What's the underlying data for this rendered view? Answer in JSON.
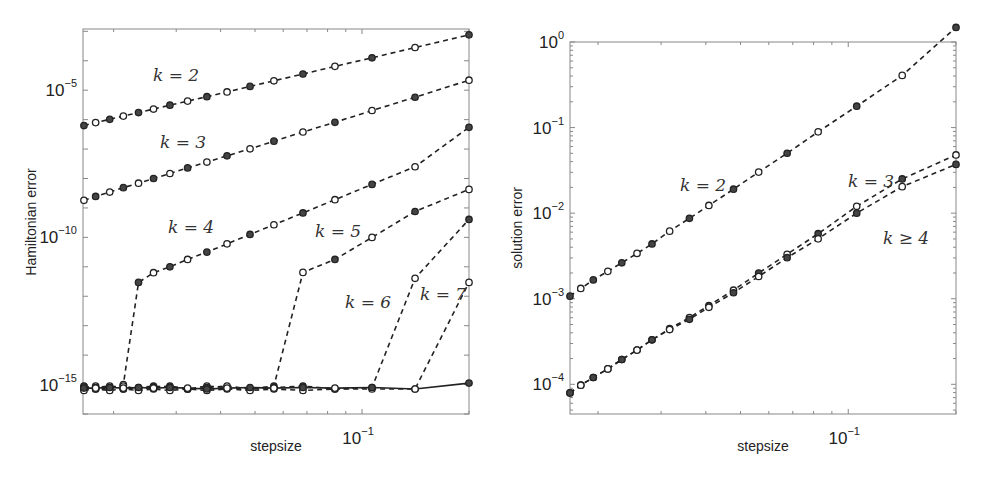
{
  "chart_data": [
    {
      "type": "line",
      "panel": "left",
      "title": "",
      "xlabel": "stepsize",
      "ylabel": "Hamiltonian error",
      "xscale": "log",
      "yscale": "log",
      "xlim": [
        0.0164,
        0.2
      ],
      "ylim": [
        1e-16,
        0.0012
      ],
      "x_ticks": [
        {
          "value": 0.1,
          "label": "10",
          "exp": "-1"
        }
      ],
      "y_ticks": [
        {
          "value": 1e-05,
          "label": "10",
          "exp": "-5"
        },
        {
          "value": 1e-10,
          "label": "10",
          "exp": "-10"
        },
        {
          "value": 1e-15,
          "label": "10",
          "exp": "-15"
        }
      ],
      "grid": false,
      "legend": "none (inline annotations)",
      "x": [
        0.0165,
        0.0178,
        0.0195,
        0.0213,
        0.0235,
        0.0259,
        0.0288,
        0.0323,
        0.0366,
        0.0417,
        0.0484,
        0.0565,
        0.0682,
        0.0839,
        0.1067,
        0.141,
        0.2
      ],
      "series": [
        {
          "name": "k = 2",
          "log10_values": [
            -6.2,
            -6.1,
            -5.99,
            -5.88,
            -5.76,
            -5.64,
            -5.51,
            -5.37,
            -5.22,
            -5.06,
            -4.87,
            -4.68,
            -4.45,
            -4.19,
            -3.9,
            -3.55,
            -3.12
          ],
          "line": "dashed"
        },
        {
          "name": "k = 3",
          "log10_values": [
            -8.74,
            -8.61,
            -8.46,
            -8.31,
            -8.16,
            -8.0,
            -7.83,
            -7.64,
            -7.44,
            -7.23,
            -6.99,
            -6.73,
            -6.42,
            -6.09,
            -5.69,
            -5.24,
            -4.66
          ],
          "line": "dashed"
        },
        {
          "name": "k = 4",
          "log10_values": [
            -15.1,
            -15.05,
            -15.1,
            -15.0,
            -11.53,
            -11.2,
            -11.0,
            -10.75,
            -10.5,
            -10.22,
            -9.9,
            -9.57,
            -9.17,
            -8.72,
            -8.2,
            -7.6,
            -6.26
          ],
          "line": "dashed"
        },
        {
          "name": "k = 5",
          "log10_values": [
            -15.15,
            -15.1,
            -15.05,
            -15.15,
            -15.1,
            -15.05,
            -15.1,
            -15.15,
            -15.05,
            -15.1,
            -15.15,
            -15.05,
            -11.19,
            -10.75,
            -10.0,
            -9.12,
            -8.37
          ],
          "line": "dashed"
        },
        {
          "name": "k = 6",
          "log10_values": [
            -15.05,
            -15.15,
            -15.1,
            -15.05,
            -15.15,
            -15.1,
            -15.05,
            -15.15,
            -15.1,
            -15.05,
            -15.15,
            -15.1,
            -15.05,
            -15.15,
            -15.1,
            -11.39,
            -9.39
          ],
          "line": "dashed"
        },
        {
          "name": "k = 7",
          "log10_values": [
            -15.2,
            -15.15,
            -15.2,
            -15.15,
            -15.2,
            -15.15,
            -15.2,
            -15.15,
            -15.2,
            -15.15,
            -15.2,
            -15.15,
            -15.2,
            -15.15,
            -15.15,
            -15.15,
            -11.53
          ],
          "line": "dashed"
        },
        {
          "name": "k = 8",
          "log10_values": [
            -15.12,
            -15.12,
            -15.1,
            -15.12,
            -15.1,
            -15.12,
            -15.1,
            -15.12,
            -15.15,
            -15.12,
            -15.1,
            -15.12,
            -15.1,
            -15.12,
            -15.1,
            -15.15,
            -14.95
          ],
          "line": "solid"
        }
      ],
      "annotations": [
        {
          "text": "k = 2",
          "x_px": 153,
          "y_px": 81
        },
        {
          "text": "k = 3",
          "x_px": 160,
          "y_px": 148
        },
        {
          "text": "k = 4",
          "x_px": 168,
          "y_px": 233
        },
        {
          "text": "k = 5",
          "x_px": 315,
          "y_px": 237
        },
        {
          "text": "k = 6",
          "x_px": 345,
          "y_px": 308
        },
        {
          "text": "k = 7",
          "x_px": 420,
          "y_px": 300
        }
      ]
    },
    {
      "type": "line",
      "panel": "right",
      "title": "",
      "xlabel": "stepsize",
      "ylabel": "solution error",
      "xscale": "log",
      "yscale": "log",
      "xlim": [
        0.0167,
        0.2
      ],
      "ylim": [
        4.5e-05,
        1
      ],
      "x_ticks": [
        {
          "value": 0.1,
          "label": "10",
          "exp": "-1"
        }
      ],
      "y_ticks": [
        {
          "value": 1,
          "label": "10",
          "exp": "0"
        },
        {
          "value": 0.1,
          "label": "10",
          "exp": "-1"
        },
        {
          "value": 0.01,
          "label": "10",
          "exp": "-2"
        },
        {
          "value": 0.001,
          "label": "10",
          "exp": "-3"
        },
        {
          "value": 0.0001,
          "label": "10",
          "exp": "-4"
        }
      ],
      "grid": false,
      "legend": "none (inline annotations)",
      "x": [
        0.0167,
        0.0179,
        0.0194,
        0.0213,
        0.0233,
        0.0257,
        0.0283,
        0.0317,
        0.036,
        0.0408,
        0.0478,
        0.0562,
        0.0675,
        0.0824,
        0.1056,
        0.1415,
        0.2
      ],
      "series": [
        {
          "name": "k = 2",
          "log10_values": [
            -2.97,
            -2.88,
            -2.78,
            -2.68,
            -2.58,
            -2.47,
            -2.36,
            -2.21,
            -2.06,
            -1.91,
            -1.72,
            -1.52,
            -1.3,
            -1.05,
            -0.75,
            -0.39,
            0.17
          ],
          "line": "dashed"
        },
        {
          "name": "k = 3",
          "log10_values": [
            -4.1,
            -4.01,
            -3.92,
            -3.82,
            -3.71,
            -3.6,
            -3.48,
            -3.35,
            -3.22,
            -3.08,
            -2.9,
            -2.7,
            -2.48,
            -2.24,
            -1.92,
            -1.6,
            -1.32
          ],
          "line": "dashed"
        },
        {
          "name": "k ≥ 4",
          "log10_values": [
            -4.1,
            -4.01,
            -3.92,
            -3.82,
            -3.71,
            -3.6,
            -3.48,
            -3.36,
            -3.24,
            -3.1,
            -2.93,
            -2.74,
            -2.52,
            -2.3,
            -2.0,
            -1.69,
            -1.43
          ],
          "line": "dashed"
        }
      ],
      "annotations": [
        {
          "text": "k = 2",
          "x_px": 680,
          "y_px": 191
        },
        {
          "text": "k = 3",
          "x_px": 848,
          "y_px": 187
        },
        {
          "text": "k ≥ 4",
          "x_px": 883,
          "y_px": 244
        }
      ]
    }
  ],
  "panels": {
    "left": {
      "xlabel": "stepsize",
      "ylabel": "Hamiltonian error"
    },
    "right": {
      "xlabel": "stepsize",
      "ylabel": "solution error"
    }
  },
  "style": {
    "line_color": "#222222",
    "axis_color": "#888888",
    "marker_fill_dark": "#444444",
    "marker_fill_open": "#ffffff"
  }
}
